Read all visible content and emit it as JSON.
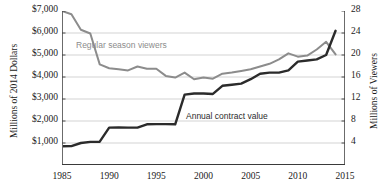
{
  "chart_data": {
    "type": "line",
    "title": "",
    "xlabel": "",
    "xlim": [
      1985,
      2015
    ],
    "x_ticks": [
      "1985",
      "1990",
      "1995",
      "2000",
      "2005",
      "2010",
      "2015"
    ],
    "x_tick_values": [
      1985,
      1990,
      1995,
      2000,
      2005,
      2010,
      2015
    ],
    "x_minor_step": 1,
    "grid": true,
    "grid_orientation": "horizontal",
    "legend_position": "inline-annotations",
    "axes": [
      {
        "id": "left",
        "label": "Millions of 2014 Dollars",
        "ylim": [
          0,
          7000
        ],
        "ticks": [
          1000,
          2000,
          3000,
          4000,
          5000,
          6000,
          7000
        ],
        "tick_labels": [
          "$1,000",
          "$2,000",
          "$3,000",
          "$4,000",
          "$5,000",
          "$6,000",
          "$7,000"
        ]
      },
      {
        "id": "right",
        "label": "Millions of Viewers",
        "ylim": [
          0,
          28
        ],
        "ticks": [
          4,
          8,
          12,
          16,
          20,
          24,
          28
        ],
        "tick_labels": [
          "4",
          "8",
          "12",
          "16",
          "20",
          "24",
          "28"
        ]
      }
    ],
    "series": [
      {
        "name": "Regular season viewers",
        "axis": "right",
        "color": "#8c8c8c",
        "units": "millions of viewers",
        "x": [
          1985,
          1986,
          1987,
          1988,
          1989,
          1990,
          1991,
          1992,
          1993,
          1994,
          1995,
          1996,
          1997,
          1998,
          1999,
          2000,
          2001,
          2002,
          2003,
          2004,
          2005,
          2006,
          2007,
          2008,
          2009,
          2010,
          2011,
          2012,
          2013,
          2014
        ],
        "values": [
          28.0,
          27.4,
          24.6,
          23.9,
          18.3,
          17.6,
          17.4,
          17.2,
          17.9,
          17.5,
          17.5,
          16.2,
          15.9,
          16.8,
          15.6,
          15.9,
          15.7,
          16.6,
          16.8,
          17.1,
          17.4,
          17.9,
          18.4,
          19.2,
          20.3,
          19.7,
          19.9,
          21.0,
          22.4,
          20.1
        ]
      },
      {
        "name": "Annual contract value",
        "axis": "left",
        "color": "#2b2b2b",
        "units": "millions of 2014 dollars",
        "x": [
          1985,
          1986,
          1987,
          1988,
          1989,
          1990,
          1991,
          1992,
          1993,
          1994,
          1995,
          1996,
          1997,
          1998,
          1999,
          2000,
          2001,
          2002,
          2003,
          2004,
          2005,
          2006,
          2007,
          2008,
          2009,
          2010,
          2011,
          2012,
          2013,
          2014
        ],
        "values": [
          850,
          860,
          1000,
          1050,
          1060,
          1700,
          1710,
          1700,
          1700,
          1850,
          1860,
          1860,
          1850,
          3200,
          3250,
          3250,
          3230,
          3600,
          3650,
          3700,
          3900,
          4150,
          4200,
          4200,
          4300,
          4700,
          4750,
          4800,
          5000,
          6100
        ]
      }
    ],
    "annotations": [
      {
        "text": "Regular season viewers",
        "series": "Regular season viewers"
      },
      {
        "text": "Annual contract value",
        "series": "Annual contract value"
      }
    ]
  }
}
